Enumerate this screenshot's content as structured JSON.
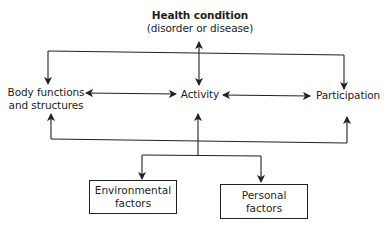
{
  "diagram": {
    "health_condition": {
      "title": "Health condition",
      "subtitle": "(disorder or disease)"
    },
    "nodes": {
      "body": {
        "line1": "Body functions",
        "line2": "and structures"
      },
      "activity": {
        "label": "Activity"
      },
      "participation": {
        "label": "Participation"
      },
      "environmental": {
        "line1": "Environmental",
        "line2": "factors"
      },
      "personal": {
        "line1": "Personal",
        "line2": "factors"
      }
    },
    "edges": [
      {
        "from": "Health condition",
        "to": "Activity",
        "type": "bidirectional"
      },
      {
        "from": "Health condition",
        "to": "Body functions and structures",
        "type": "directed"
      },
      {
        "from": "Health condition",
        "to": "Participation",
        "type": "directed"
      },
      {
        "from": "Body functions and structures",
        "to": "Activity",
        "type": "bidirectional"
      },
      {
        "from": "Activity",
        "to": "Participation",
        "type": "bidirectional"
      },
      {
        "from": "Contextual factors",
        "to": "Body functions and structures",
        "type": "directed"
      },
      {
        "from": "Contextual factors",
        "to": "Activity",
        "type": "directed"
      },
      {
        "from": "Contextual factors",
        "to": "Participation",
        "type": "directed"
      },
      {
        "from": "Contextual factors",
        "to": "Environmental factors",
        "type": "directed"
      },
      {
        "from": "Contextual factors",
        "to": "Personal factors",
        "type": "directed"
      }
    ],
    "colors": {
      "line": "#222222",
      "text": "#1e1e1e",
      "background": "#ffffff"
    }
  }
}
